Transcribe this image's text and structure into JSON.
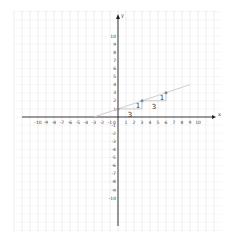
{
  "chart_data": {
    "type": "line",
    "title": "",
    "xlabel": "x",
    "ylabel": "y",
    "xlim": [
      -10,
      10
    ],
    "ylim": [
      -10,
      10
    ],
    "grid": true,
    "x_ticks": [
      "-10",
      "-9",
      "-8",
      "-7",
      "-6",
      "-5",
      "-4",
      "-3",
      "-2",
      "-1",
      "1",
      "2",
      "3",
      "4",
      "5",
      "6",
      "7",
      "8",
      "9",
      "10"
    ],
    "y_ticks": [
      "10",
      "9",
      "8",
      "7",
      "6",
      "5",
      "4",
      "3",
      "2",
      "1",
      "-1",
      "-2",
      "-3",
      "-4",
      "-5",
      "-6",
      "-7",
      "-8",
      "-9",
      "-10"
    ],
    "origin_label": "0",
    "series": [
      {
        "name": "line",
        "equation": "y = (1/3)x + 1",
        "slope": 0.3333,
        "y_intercept": 1,
        "x": [
          -3,
          9
        ],
        "y": [
          0,
          4
        ]
      }
    ],
    "points": [
      {
        "x": 0,
        "y": 1
      },
      {
        "x": 3,
        "y": 2
      },
      {
        "x": 6,
        "y": 3
      }
    ],
    "annotations": [
      {
        "type": "run",
        "text": "3",
        "from": [
          0,
          1
        ],
        "to": [
          3,
          1
        ]
      },
      {
        "type": "rise",
        "text": "1",
        "from": [
          3,
          1
        ],
        "to": [
          3,
          2
        ]
      },
      {
        "type": "run",
        "text": "3",
        "from": [
          3,
          2
        ],
        "to": [
          6,
          2
        ]
      },
      {
        "type": "rise",
        "text": "1",
        "from": [
          6,
          2
        ],
        "to": [
          6,
          3
        ]
      }
    ]
  },
  "colors": {
    "grid": "#d8d8d8",
    "axis": "#222222",
    "line": "#c8c8c8",
    "point": "#888888"
  }
}
